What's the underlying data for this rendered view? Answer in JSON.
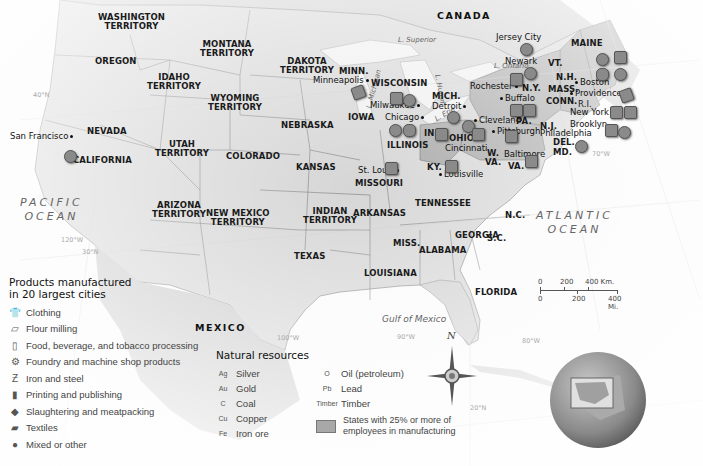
{
  "map": {
    "countries": {
      "canada": "CANADA",
      "mexico": "MEXICO"
    },
    "oceans": {
      "pacific": [
        "PACIFIC",
        "OCEAN"
      ],
      "atlantic": [
        "ATLANTIC",
        "OCEAN"
      ],
      "gulf": "Gulf of Mexico"
    },
    "lakes": {
      "superior": "L. Superior",
      "michigan": "L. Michigan",
      "huron": "L. Huron",
      "erie": "L. Erie",
      "ontario": "L. Ontario"
    },
    "grid_labels": {
      "lat40": "40°N",
      "lat30": "30°N",
      "lat20": "20°N",
      "lon120": "120°W",
      "lon100": "100°W",
      "lon90": "90°W",
      "lon80": "80°W",
      "lon70": "70°W"
    },
    "states": [
      {
        "id": "washington",
        "label": [
          "WASHINGTON",
          "TERRITORY"
        ]
      },
      {
        "id": "oregon",
        "label": [
          "OREGON"
        ]
      },
      {
        "id": "idaho",
        "label": [
          "IDAHO",
          "TERRITORY"
        ]
      },
      {
        "id": "montana",
        "label": [
          "MONTANA",
          "TERRITORY"
        ]
      },
      {
        "id": "wyoming",
        "label": [
          "WYOMING",
          "TERRITORY"
        ]
      },
      {
        "id": "dakota",
        "label": [
          "DAKOTA",
          "TERRITORY"
        ]
      },
      {
        "id": "minn",
        "label": [
          "MINN."
        ]
      },
      {
        "id": "wisconsin",
        "label": [
          "WISCONSIN"
        ]
      },
      {
        "id": "mich",
        "label": [
          "MICH."
        ]
      },
      {
        "id": "nevada",
        "label": [
          "NEVADA"
        ]
      },
      {
        "id": "california",
        "label": [
          "CALIFORNIA"
        ]
      },
      {
        "id": "utah",
        "label": [
          "UTAH",
          "TERRITORY"
        ]
      },
      {
        "id": "colorado",
        "label": [
          "COLORADO"
        ]
      },
      {
        "id": "nebraska",
        "label": [
          "NEBRASKA"
        ]
      },
      {
        "id": "iowa",
        "label": [
          "IOWA"
        ]
      },
      {
        "id": "illinois",
        "label": [
          "ILLINOIS"
        ]
      },
      {
        "id": "ind",
        "label": [
          "IND."
        ]
      },
      {
        "id": "ohio",
        "label": [
          "OHIO"
        ]
      },
      {
        "id": "pa",
        "label": [
          "PA."
        ]
      },
      {
        "id": "ny",
        "label": [
          "N.Y."
        ]
      },
      {
        "id": "maine",
        "label": [
          "MAINE"
        ]
      },
      {
        "id": "vt",
        "label": [
          "VT."
        ]
      },
      {
        "id": "nh",
        "label": [
          "N.H."
        ]
      },
      {
        "id": "mass",
        "label": [
          "MASS."
        ]
      },
      {
        "id": "conn",
        "label": [
          "CONN."
        ]
      },
      {
        "id": "ri",
        "label": [
          "R.I."
        ]
      },
      {
        "id": "nj",
        "label": [
          "N.J."
        ]
      },
      {
        "id": "del",
        "label": [
          "DEL."
        ]
      },
      {
        "id": "md",
        "label": [
          "MD."
        ]
      },
      {
        "id": "wva",
        "label": [
          "W.",
          "VA."
        ]
      },
      {
        "id": "va",
        "label": [
          "VA."
        ]
      },
      {
        "id": "ky",
        "label": [
          "KY."
        ]
      },
      {
        "id": "kansas",
        "label": [
          "KANSAS"
        ]
      },
      {
        "id": "missouri",
        "label": [
          "MISSOURI"
        ]
      },
      {
        "id": "arizona",
        "label": [
          "ARIZONA",
          "TERRITORY"
        ]
      },
      {
        "id": "newmexico",
        "label": [
          "NEW MEXICO",
          "TERRITORY"
        ]
      },
      {
        "id": "indian",
        "label": [
          "INDIAN",
          "TERRITORY"
        ]
      },
      {
        "id": "arkansas",
        "label": [
          "ARKANSAS"
        ]
      },
      {
        "id": "tennessee",
        "label": [
          "TENNESSEE"
        ]
      },
      {
        "id": "nc",
        "label": [
          "N.C."
        ]
      },
      {
        "id": "sc",
        "label": [
          "S.C."
        ]
      },
      {
        "id": "georgia",
        "label": [
          "GEORGIA"
        ]
      },
      {
        "id": "alabama",
        "label": [
          "ALABAMA"
        ]
      },
      {
        "id": "miss",
        "label": [
          "MISS."
        ]
      },
      {
        "id": "texas",
        "label": [
          "TEXAS"
        ]
      },
      {
        "id": "louisiana",
        "label": [
          "LOUISIANA"
        ]
      },
      {
        "id": "florida",
        "label": [
          "FLORIDA"
        ]
      }
    ],
    "cities": [
      "San Francisco",
      "Minneapolis",
      "Milwaukee",
      "Chicago",
      "Detroit",
      "Cleveland",
      "Cincinnati",
      "St. Louis",
      "Louisville",
      "Pittsburgh",
      "Baltimore",
      "Philadelphia",
      "Brooklyn",
      "New York",
      "Providence",
      "Boston",
      "Newark",
      "Jersey City",
      "Rochester",
      "Buffalo"
    ],
    "manufacturing_states": [
      "MAINE",
      "N.H.",
      "MASS.",
      "R.I.",
      "CONN.",
      "N.Y.",
      "N.J.",
      "PA.",
      "DEL.",
      "OHIO",
      "MD."
    ],
    "compass": "N"
  },
  "legend_products": {
    "title": [
      "Products manufactured",
      "in 20 largest cities"
    ],
    "items": [
      {
        "icon": "clothing-icon",
        "glyph": "👕",
        "label": "Clothing"
      },
      {
        "icon": "flour-milling-icon",
        "glyph": "▱",
        "label": "Flour milling"
      },
      {
        "icon": "food-beverage-icon",
        "glyph": "▯",
        "label": "Food, beverage, and tobacco processing"
      },
      {
        "icon": "foundry-icon",
        "glyph": "⚙",
        "label": "Foundry and machine shop products"
      },
      {
        "icon": "iron-steel-icon",
        "glyph": "Ƶ",
        "label": "Iron and steel"
      },
      {
        "icon": "printing-icon",
        "glyph": "▮",
        "label": "Printing and publishing"
      },
      {
        "icon": "slaughtering-icon",
        "glyph": "◆",
        "label": "Slaughtering and meatpacking"
      },
      {
        "icon": "textiles-icon",
        "glyph": "▰",
        "label": "Textiles"
      },
      {
        "icon": "mixed-icon",
        "glyph": "●",
        "label": "Mixed or other"
      }
    ]
  },
  "legend_resources": {
    "title": "Natural resources",
    "items": [
      {
        "symbol": "Ag",
        "label": "Silver"
      },
      {
        "symbol": "Au",
        "label": "Gold"
      },
      {
        "symbol": "C",
        "label": "Coal"
      },
      {
        "symbol": "Cu",
        "label": "Copper"
      },
      {
        "symbol": "Fe",
        "label": "Iron ore"
      },
      {
        "symbol": "O",
        "label": "Oil (petroleum)"
      },
      {
        "symbol": "Pb",
        "label": "Lead"
      },
      {
        "symbol": "Timber",
        "label": "Timber"
      }
    ],
    "shaded_label": [
      "States with 25% or more of",
      "employees in manufacturing"
    ],
    "shaded_color": "#a8a8a8"
  },
  "scale": {
    "km_ticks": [
      "0",
      "200",
      "400 Km."
    ],
    "mi_ticks": [
      "0",
      "200",
      "400 Mi."
    ]
  },
  "colors": {
    "land": "#d6d6d6",
    "land_light": "#e2e2e2",
    "foreign_land": "#c9c9c9",
    "water": "#f4f4f4",
    "manufacturing": "#a8a8a8",
    "border": "#666666"
  }
}
